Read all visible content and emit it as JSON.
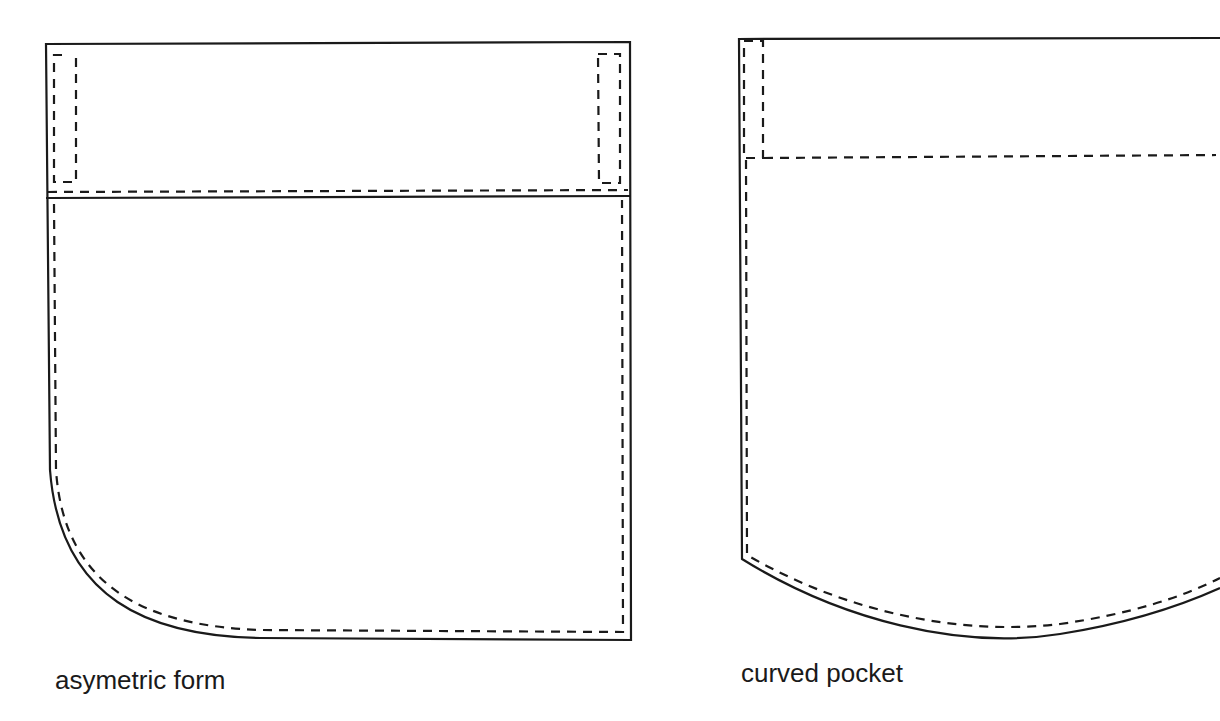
{
  "diagram": {
    "type": "pocket-pattern-illustrations",
    "line_color": "#1a1a1a",
    "background": "#ffffff",
    "figures": [
      {
        "id": "asymmetric",
        "label": "asymetric form",
        "parts": [
          "outer-outline",
          "flap-band",
          "band-seam-line",
          "topstitch-dashed-line",
          "left-tab-dashed",
          "right-tab-dashed"
        ]
      },
      {
        "id": "curved",
        "label": "curved pocket",
        "parts": [
          "outer-outline",
          "curved-bottom",
          "band-dashed-line",
          "topstitch-dashed-line",
          "left-tab-dashed"
        ]
      }
    ]
  }
}
